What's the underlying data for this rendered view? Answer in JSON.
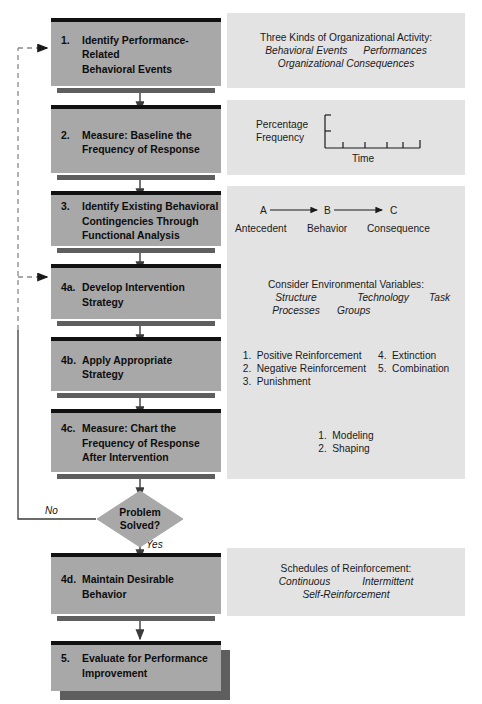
{
  "diagram": {
    "colors": {
      "box_body": "#a8a8a8",
      "box_top_bar": "#111111",
      "box_bottom_bar": "#5e5e5e",
      "panel_bg": "#e3e3e3",
      "diamond_fill": "#a8a8a8",
      "line": "#3b3b3b",
      "page_bg": "#ffffff"
    },
    "steps": [
      {
        "id": "step-1",
        "num": "1.",
        "text": "Identify Performance-Related\nBehavioral Events"
      },
      {
        "id": "step-2",
        "num": "2.",
        "text": "Measure: Baseline the\nFrequency of Response"
      },
      {
        "id": "step-3",
        "num": "3.",
        "text": "Identify Existing Behavioral\nContingencies Through\nFunctional Analysis"
      },
      {
        "id": "step-4a",
        "num": "4a.",
        "text": "Develop Intervention\nStrategy"
      },
      {
        "id": "step-4b",
        "num": "4b.",
        "text": "Apply Appropriate\nStrategy"
      },
      {
        "id": "step-4c",
        "num": "4c.",
        "text": "Measure: Chart the\nFrequency of Response\nAfter Intervention"
      },
      {
        "id": "step-4d",
        "num": "4d.",
        "text": "Maintain Desirable\nBehavior"
      },
      {
        "id": "step-5",
        "num": "5.",
        "text": "Evaluate for Performance\nImprovement"
      }
    ],
    "decision": {
      "id": "decision-problem-solved",
      "text": "Problem\nSolved?",
      "yes_label": "Yes",
      "no_label": "No"
    },
    "panels": {
      "p1": {
        "title": "Three Kinds of Organizational Activity:",
        "row1": [
          "Behavioral Events",
          "Performances"
        ],
        "row2": [
          "Organizational Consequences"
        ]
      },
      "p2": {
        "y_label_line1": "Percentage",
        "y_label_line2": "Frequency",
        "x_label": "Time"
      },
      "p3": {
        "letters": [
          "A",
          "B",
          "C"
        ],
        "words": [
          "Antecedent",
          "Behavior",
          "Consequence"
        ]
      },
      "p4a": {
        "title": "Consider Environmental Variables:",
        "row1": [
          "Structure",
          "Technology",
          "Task"
        ],
        "row2": [
          "Processes",
          "Groups"
        ]
      },
      "p4b": {
        "col1": [
          {
            "num": "1.",
            "text": "Positive Reinforcement"
          },
          {
            "num": "2.",
            "text": "Negative Reinforcement"
          },
          {
            "num": "3.",
            "text": "Punishment"
          }
        ],
        "col2": [
          {
            "num": "4.",
            "text": "Extinction"
          },
          {
            "num": "5.",
            "text": "Combination"
          }
        ]
      },
      "p4c": {
        "items": [
          {
            "num": "1.",
            "text": "Modeling"
          },
          {
            "num": "2.",
            "text": "Shaping"
          }
        ]
      },
      "p4d": {
        "title": "Schedules of Reinforcement:",
        "row1": [
          "Continuous",
          "Intermittent"
        ],
        "row2": [
          "Self-Reinforcement"
        ]
      }
    }
  }
}
